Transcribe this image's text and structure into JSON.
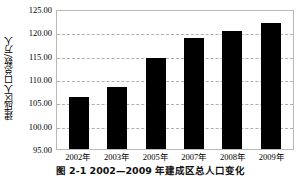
{
  "chart_data": {
    "type": "bar",
    "title": "",
    "xlabel": "",
    "ylabel": "建成区人口总数/万人",
    "categories": [
      "2002年",
      "2003年",
      "2005年",
      "2007年",
      "2008年",
      "2009年"
    ],
    "values": [
      106.2,
      108.3,
      114.4,
      118.7,
      120.2,
      122.1
    ],
    "series": [
      {
        "name": "建成区人口总数",
        "values": [
          106.2,
          108.3,
          114.4,
          118.7,
          120.2,
          122.1
        ]
      }
    ],
    "ylim": [
      95.0,
      125.0
    ],
    "ytick_values": [
      95.0,
      100.0,
      105.0,
      110.0,
      115.0,
      120.0,
      125.0
    ],
    "ytick_labels": [
      "95.00",
      "100.00",
      "105.00",
      "110.00",
      "115.00",
      "120.00",
      "125.00"
    ],
    "grid": true,
    "grid_axis": "y",
    "legend": false,
    "legend_position": "none",
    "bar_color": "#000000",
    "grid_color": "#b0b0b0",
    "frame_color": "#b9b9b9",
    "background_color": "#ffffff"
  },
  "caption": {
    "text": "图 2-1  2002—2009 年建成区总人口变化"
  }
}
